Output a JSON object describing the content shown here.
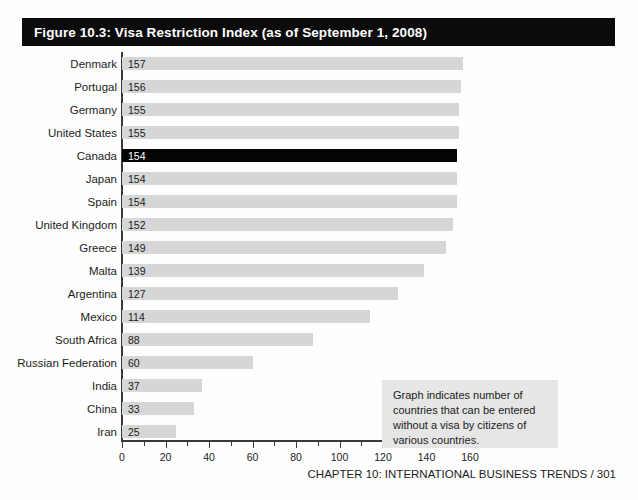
{
  "figure": {
    "title": "Figure 10.3: Visa Restriction Index (as of September 1, 2008)",
    "annotation": "Graph indicates number of countries that can be entered without a visa by citizens of various countries.",
    "footer": "CHAPTER 10: INTERNATIONAL BUSINESS TRENDS / 301",
    "colors": {
      "title_bar_background": "#0b0b0b",
      "title_text": "#ffffff",
      "bar": "#d6d6d6",
      "bar_highlight": "#050505",
      "annotation_background": "#e6e6e6",
      "axis": "#3a3a3a"
    }
  },
  "chart_data": {
    "type": "bar",
    "orientation": "horizontal",
    "title": "Figure 10.3: Visa Restriction Index (as of September 1, 2008)",
    "xlabel": "",
    "ylabel": "",
    "xlim": [
      0,
      160
    ],
    "xticks": [
      0,
      20,
      40,
      60,
      80,
      100,
      120,
      140,
      160
    ],
    "minor_tick_interval": 10,
    "grid": false,
    "legend": "none",
    "highlight_category": "Canada",
    "annotation": "Graph indicates number of countries that can be entered without a visa by citizens of various countries.",
    "categories": [
      "Denmark",
      "Portugal",
      "Germany",
      "United States",
      "Canada",
      "Japan",
      "Spain",
      "United Kingdom",
      "Greece",
      "Malta",
      "Argentina",
      "Mexico",
      "South Africa",
      "Russian Federation",
      "India",
      "China",
      "Iran"
    ],
    "values": [
      157,
      156,
      155,
      155,
      154,
      154,
      154,
      152,
      149,
      139,
      127,
      114,
      88,
      60,
      37,
      33,
      25
    ]
  }
}
